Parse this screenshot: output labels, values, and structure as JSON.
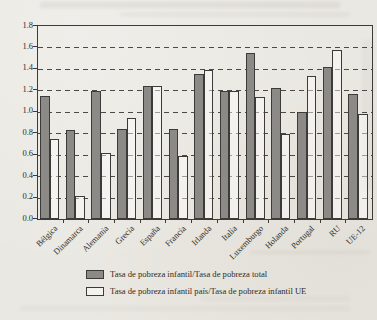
{
  "chart_data": {
    "type": "bar",
    "title": "",
    "categories": [
      "Bélgica",
      "Dinamarca",
      "Alemania",
      "Grecia",
      "España",
      "Francia",
      "Irlanda",
      "Italia",
      "Luxemburgo",
      "Holanda",
      "Portugal",
      "RU",
      "UE-12"
    ],
    "series": [
      {
        "name": "Tasa de pobreza infantil/Tasa de pobreza total",
        "style": "gray",
        "color": "#8b8a87",
        "values": [
          1.15,
          0.83,
          1.19,
          0.84,
          1.24,
          0.84,
          1.35,
          1.19,
          1.55,
          1.22,
          1.0,
          1.42,
          1.17
        ]
      },
      {
        "name": "Tasa de pobreza infantil país/Tasa de pobreza infantil UE",
        "style": "white",
        "color": "transparent",
        "values": [
          0.75,
          0.21,
          0.62,
          0.94,
          1.24,
          0.59,
          1.39,
          1.19,
          1.14,
          0.79,
          1.33,
          1.58,
          0.98
        ]
      }
    ],
    "xlabel": "",
    "ylabel": "",
    "ylim": [
      0,
      1.8
    ],
    "ytick_step": 0.2,
    "ytick_labels": [
      "1.8",
      "1.6",
      "1.4",
      "1.2",
      "1.0",
      "0.8",
      "0.6",
      "0.4",
      "0.2",
      "0.0"
    ],
    "grid": "horizontal-dashed",
    "legend_position": "bottom"
  },
  "legend": {
    "items": [
      {
        "label": "Tasa de pobreza infantil/Tasa de pobreza total",
        "swatch": "gray"
      },
      {
        "label": "Tasa de pobreza infantil país/Tasa de pobreza infantil UE",
        "swatch": "white"
      }
    ]
  },
  "colors": {
    "paper": "#eae8e2",
    "bar_gray": "#8b8a87",
    "line": "#3c3b38",
    "text": "#2e2c28"
  }
}
